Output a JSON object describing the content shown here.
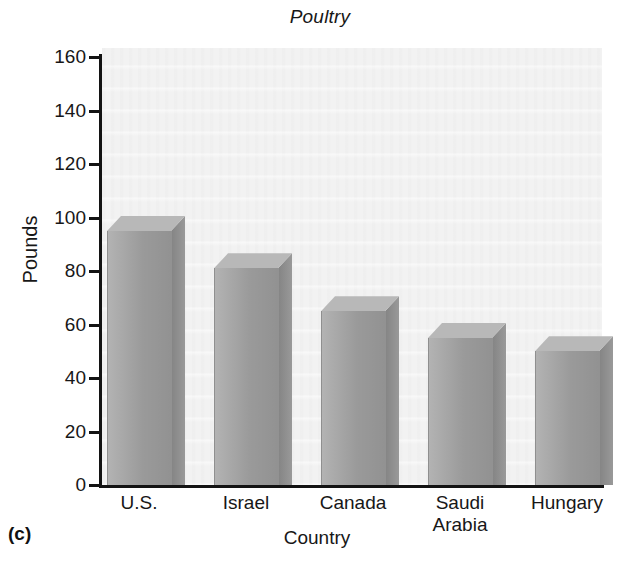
{
  "figure": {
    "panel_letter": "(c)"
  },
  "chart_data": {
    "type": "bar",
    "title": "Poultry",
    "xlabel": "Country",
    "ylabel": "Pounds",
    "categories": [
      "U.S.",
      "Israel",
      "Canada",
      "Saudi Arabia",
      "Hungary"
    ],
    "category_lines": [
      [
        "U.S."
      ],
      [
        "Israel"
      ],
      [
        "Canada"
      ],
      [
        "Saudi",
        "Arabia"
      ],
      [
        "Hungary"
      ]
    ],
    "values": [
      95,
      81,
      65,
      55,
      50
    ],
    "ylim": [
      0,
      160
    ],
    "ytick_step": 20,
    "yticks": [
      0,
      20,
      40,
      60,
      80,
      100,
      120,
      140,
      160
    ],
    "ytick_labels": [
      "0",
      "20",
      "40",
      "60",
      "80",
      "100",
      "120",
      "140",
      "160"
    ],
    "grid": false,
    "legend": "none",
    "style": "3d-bars",
    "colors": {
      "bar_front": "#a2a2a2",
      "bar_side": "#8b8b8b",
      "bar_top": "#b8b8b8",
      "plot_background": "#f2f2f2",
      "axis": "#131313",
      "text": "#171717"
    }
  }
}
